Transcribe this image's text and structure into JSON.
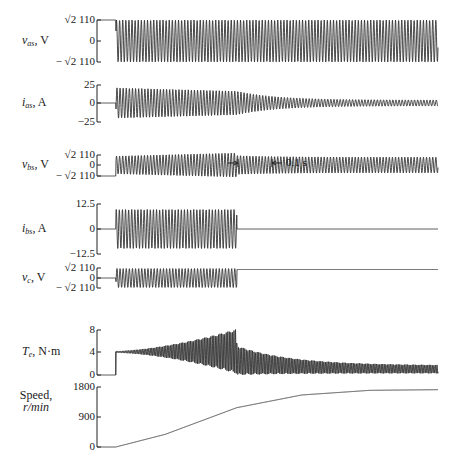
{
  "chart_data": {
    "type": "line",
    "title": "",
    "time_scale_annotation": "0.1 s",
    "switch_on_fraction": 0.055,
    "aux_cutout_fraction": 0.41,
    "panels": [
      {
        "id": "vas",
        "ylabel": "v_as, V",
        "ylabel_main": "v",
        "ylabel_sub": "as",
        "ylabel_unit": ", V",
        "ticks": [
          "√2 110",
          "0",
          "− √2 110"
        ],
        "tick_values": [
          155.6,
          0,
          -155.6
        ],
        "ylim": [
          -155.6,
          155.6
        ],
        "description": "Sinusoidal supply voltage; held at +√2·110 before switch closes, then constant-amplitude 60 Hz sine"
      },
      {
        "id": "ias",
        "ylabel": "i_as, A",
        "ylabel_main": "i",
        "ylabel_sub": "as",
        "ylabel_unit": ", A",
        "ticks": [
          "25",
          "0",
          "−25"
        ],
        "tick_values": [
          25,
          0,
          -25
        ],
        "ylim": [
          -25,
          25
        ],
        "description": "Main winding current: ~20 A peak at start decreasing slowly, then decaying to ~4 A peak at steady state"
      },
      {
        "id": "vbs",
        "ylabel": "v_bs, V",
        "ylabel_main": "v",
        "ylabel_sub": "bs",
        "ylabel_unit": ", V",
        "ticks": [
          "√2 110",
          "0",
          "− √2 110"
        ],
        "tick_values": [
          155.6,
          0,
          -155.6
        ],
        "ylim": [
          -155.6,
          155.6
        ],
        "description": "Auxiliary winding voltage; amplitude grows until cutout, then induced voltage"
      },
      {
        "id": "ibs",
        "ylabel": "i_bs, A",
        "ylabel_main": "i",
        "ylabel_sub": "bs",
        "ylabel_unit": ", A",
        "ticks": [
          "12.5",
          "0",
          "−12.5"
        ],
        "tick_values": [
          12.5,
          0,
          -12.5
        ],
        "ylim": [
          -12.5,
          12.5
        ],
        "description": "Auxiliary winding current ~10 A peak, goes to zero at cutout"
      },
      {
        "id": "vc",
        "ylabel": "v_c, V",
        "ylabel_main": "v",
        "ylabel_sub": "c",
        "ylabel_unit": ", V",
        "ticks": [
          "√2 110",
          "0",
          "− √2 110"
        ],
        "tick_values": [
          155.6,
          0,
          -155.6
        ],
        "ylim": [
          -155.6,
          155.6
        ],
        "description": "Capacitor voltage; oscillates then holds constant DC level after cutout"
      },
      {
        "id": "te",
        "ylabel": "T_e, N·m",
        "ylabel_main": "T",
        "ylabel_sub": "e",
        "ylabel_unit": ", N·m",
        "ticks": [
          "8",
          "4",
          "0"
        ],
        "tick_values": [
          8,
          4,
          0
        ],
        "ylim": [
          0,
          8
        ],
        "description": "Electromagnetic torque: steps to ~4 N·m, growing 120 Hz pulsation reaching 0–8 N·m before cutout, then pulsating ~0–5 decreasing to ~0.3–1.7 N·m"
      },
      {
        "id": "speed",
        "ylabel": "Speed, r/min",
        "ylabel_main": "Speed,",
        "ylabel_line2": "r/min",
        "ticks": [
          "1800",
          "900",
          "0"
        ],
        "tick_values": [
          1800,
          900,
          0
        ],
        "ylim": [
          0,
          1800
        ],
        "points_fraction_time": [
          0,
          0.055,
          0.2,
          0.41,
          0.6,
          0.8,
          1.0
        ],
        "points_value": [
          0,
          0,
          380,
          1180,
          1560,
          1700,
          1720
        ],
        "description": "Rotor speed ramps from 0 to ~1720 r/min"
      }
    ],
    "grid": false,
    "legend": null
  }
}
